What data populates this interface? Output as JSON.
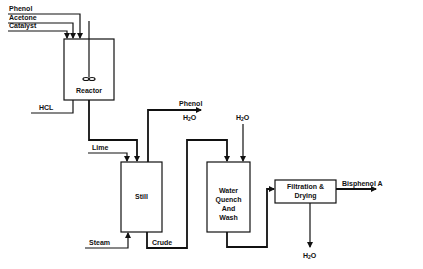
{
  "diagram": {
    "type": "process-flow",
    "title": "",
    "units": [
      {
        "id": "reactor",
        "label": "Reactor"
      },
      {
        "id": "still",
        "label": "Still"
      },
      {
        "id": "quench",
        "label_lines": [
          "Water",
          "Quench",
          "And",
          "Wash"
        ]
      },
      {
        "id": "filtration",
        "label_lines": [
          "Filtration &",
          "Drying"
        ]
      }
    ],
    "streams": {
      "phenol_in": "Phenol",
      "acetone_in": "Acetone",
      "catalyst_in": "Catalyst",
      "hcl": "HCL",
      "lime": "Lime",
      "steam": "Steam",
      "crude": "Crude",
      "still_overhead_1": "Phenol",
      "still_overhead_2_base": "H",
      "still_overhead_2_sub": "2",
      "still_overhead_2_tail": "O",
      "quench_water_base": "H",
      "quench_water_sub": "2",
      "quench_water_tail": "O",
      "filtration_water_base": "H",
      "filtration_water_sub": "2",
      "filtration_water_tail": "O",
      "product": "Bisphenol A"
    },
    "colors": {
      "line": "#111111",
      "background": "#ffffff"
    }
  }
}
